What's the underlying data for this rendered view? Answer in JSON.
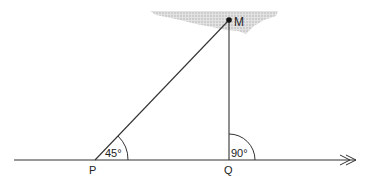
{
  "diagram": {
    "points": {
      "M": {
        "label": "M",
        "x": 229,
        "y": 20
      },
      "P": {
        "label": "P",
        "x": 95,
        "y": 160
      },
      "Q": {
        "label": "Q",
        "x": 229,
        "y": 160
      }
    },
    "angles": {
      "P": {
        "label": "45°"
      },
      "Q": {
        "label": "90°"
      }
    },
    "colors": {
      "line": "#333333",
      "shade": "#c8c8c8"
    }
  }
}
